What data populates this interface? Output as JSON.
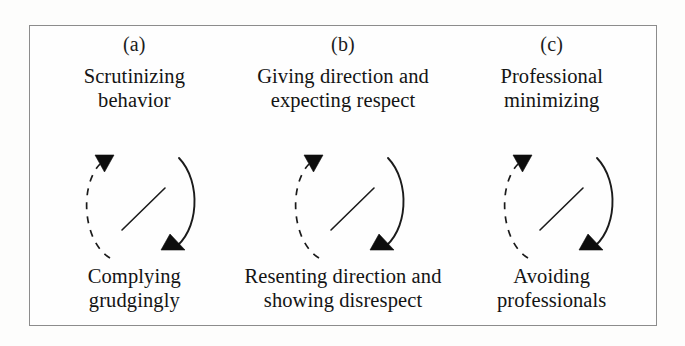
{
  "figure": {
    "border_color": "#8c8c8c",
    "background_color": "#fefefe",
    "ink_color": "#1b1b1b"
  },
  "panels": [
    {
      "letter": "(a)",
      "top_label": "Scrutinizing\nbehavior",
      "bottom_label": "Complying\ngrudgingly"
    },
    {
      "letter": "(b)",
      "top_label": "Giving direction and\nexpecting respect",
      "bottom_label": "Resenting direction and\nshowing disrespect"
    },
    {
      "letter": "(c)",
      "top_label": "Professional\nminimizing",
      "bottom_label": "Avoiding\nprofessionals"
    }
  ]
}
